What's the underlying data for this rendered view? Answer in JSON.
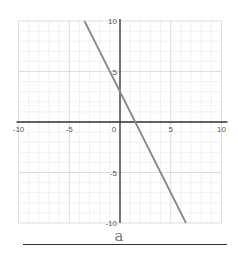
{
  "chart_data": {
    "type": "line",
    "title": "",
    "xlabel": "",
    "ylabel": "",
    "xlim": [
      -10,
      10
    ],
    "ylim": [
      -10,
      10
    ],
    "grid": true,
    "x_ticks": [
      -10,
      -5,
      0,
      5,
      10
    ],
    "y_ticks": [
      10,
      5,
      -5,
      -10
    ],
    "series": [
      {
        "name": "line",
        "equation": "y = -2x + 3",
        "x": [
          -3.5,
          6.5
        ],
        "y": [
          10,
          -10
        ]
      }
    ],
    "caption": "a"
  },
  "colors": {
    "grid": "#e2e2e2",
    "grid_major": "#cfcfcf",
    "axis": "#333333",
    "line": "#888888",
    "tick_label": "#555555"
  }
}
